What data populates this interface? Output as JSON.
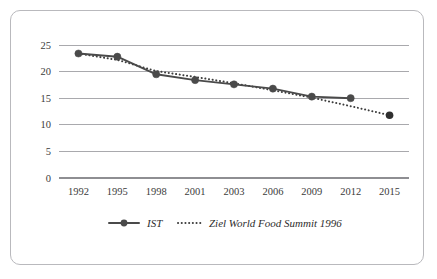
{
  "top_sliver_text": "",
  "chart_data": {
    "type": "line",
    "title": "",
    "subtitle": "",
    "xlabel": "",
    "ylabel": "",
    "categories": [
      "1992",
      "1995",
      "1998",
      "2001",
      "2003",
      "2006",
      "2009",
      "2012",
      "2015"
    ],
    "ylim": [
      0,
      25
    ],
    "yticks": [
      0,
      5,
      10,
      15,
      20,
      25
    ],
    "ytick_labels": [
      "0",
      "5",
      "10",
      "15",
      "20",
      "25"
    ],
    "grid": "horizontal",
    "legend_position": "bottom-center",
    "series": [
      {
        "name": "IST",
        "style": "solid-with-markers",
        "color": "#4a4a4a",
        "values": [
          23.4,
          22.8,
          19.5,
          18.4,
          17.6,
          16.8,
          15.3,
          15.0,
          null
        ]
      },
      {
        "name": "Ziel World Food Summit 1996",
        "style": "dotted",
        "color": "#3d3d3d",
        "values": [
          23.4,
          22.2,
          20.1,
          19.0,
          17.8,
          16.5,
          15.1,
          13.5,
          11.8
        ]
      }
    ]
  },
  "legend": {
    "items": [
      {
        "label": "IST",
        "marker": "solid-line-dot"
      },
      {
        "label": "Ziel World Food Summit 1996",
        "marker": "dotted-line"
      }
    ]
  },
  "colors": {
    "frame_border": "#b9b9bd",
    "grid": "#a9a9ad",
    "axis": "#8e8e92",
    "series_ist": "#4a4a4a",
    "series_ziel": "#3d3d3d",
    "tick_text": "#3b3b3b"
  }
}
